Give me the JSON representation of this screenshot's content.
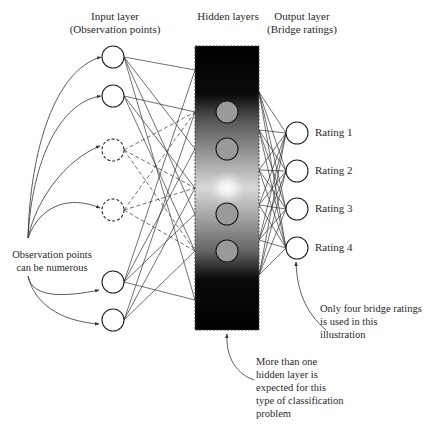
{
  "headers": {
    "input": [
      "Input layer",
      "(Observation points)"
    ],
    "hidden": [
      "Hidden layers"
    ],
    "output": [
      "Output layer",
      "(Bridge ratings)"
    ]
  },
  "output_labels": [
    "Rating 1",
    "Rating 2",
    "Rating 3",
    "Rating 4"
  ],
  "annotations": {
    "observation": [
      "Observation points",
      "can be numerous"
    ],
    "ratings": [
      "Only four bridge ratings",
      "is used in this",
      "illustration"
    ],
    "hidden": [
      "More than one",
      "hidden layer is",
      "expected for this",
      "type of classification",
      "problem"
    ]
  },
  "nodes": {
    "input": [
      {
        "x": 113,
        "y": 57,
        "style": "solid"
      },
      {
        "x": 113,
        "y": 96,
        "style": "solid"
      },
      {
        "x": 113,
        "y": 150,
        "style": "dashed"
      },
      {
        "x": 113,
        "y": 210,
        "style": "dashed"
      },
      {
        "x": 113,
        "y": 282,
        "style": "solid"
      },
      {
        "x": 113,
        "y": 320,
        "style": "solid"
      }
    ],
    "hidden": [
      {
        "x": 227,
        "y": 112
      },
      {
        "x": 227,
        "y": 149
      },
      {
        "x": 227,
        "y": 214
      },
      {
        "x": 227,
        "y": 251
      }
    ],
    "output": [
      {
        "x": 297,
        "y": 133
      },
      {
        "x": 297,
        "y": 171
      },
      {
        "x": 297,
        "y": 209
      },
      {
        "x": 297,
        "y": 248
      }
    ]
  },
  "hidden_box": {
    "x": 195,
    "y": 46,
    "w": 64,
    "h": 284
  },
  "colors": {
    "line": "#333333",
    "box_dark": "#050505",
    "box_light": "#f2f2f2",
    "hidden_node_fill": "#9a9a9a"
  }
}
